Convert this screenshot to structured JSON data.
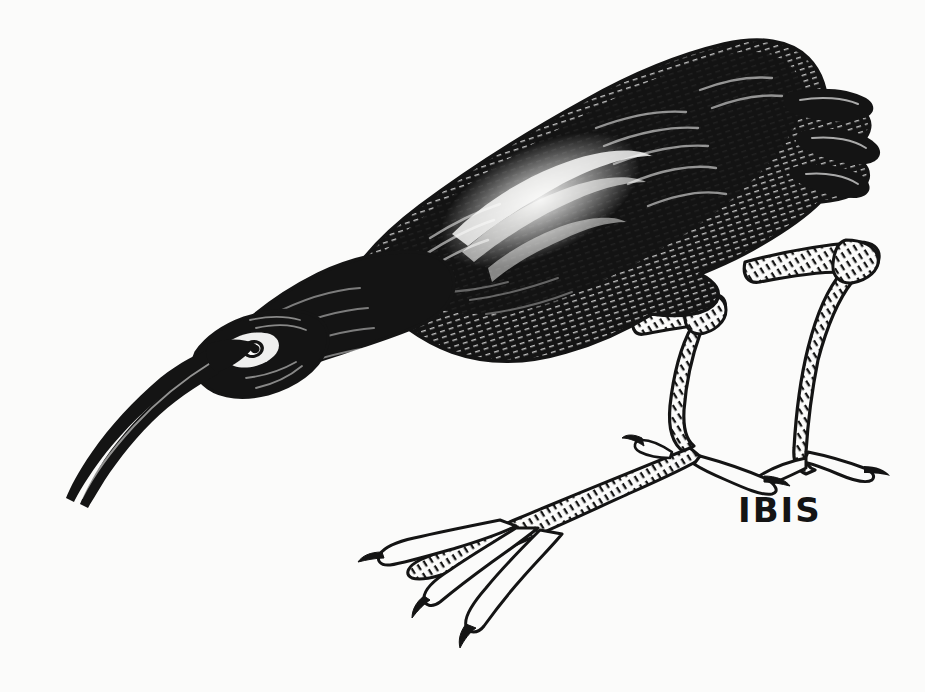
{
  "artwork": {
    "title": "IBIS",
    "caption": "IBIS",
    "medium": "pen-and-ink line drawing",
    "subject": "ibis bird in foraging posture, head lowered, long decurved bill pointed down-left",
    "orientation": "bird faces left",
    "canvas": {
      "width": 925,
      "height": 692,
      "background_color": "#fbfbfa",
      "ink_color": "#141414"
    },
    "caption_position": {
      "x": 738,
      "y": 522
    },
    "parts": [
      {
        "name": "bill",
        "description": "long slender decurved bill sweeping down and left"
      },
      {
        "name": "head",
        "description": "small dark head with pale eye patch and ringed eye"
      },
      {
        "name": "eye",
        "description": "white ring with dark pupil"
      },
      {
        "name": "neck",
        "description": "thick dark neck angled down-left from body"
      },
      {
        "name": "body",
        "description": "heavy dark crosshatched body and mantle"
      },
      {
        "name": "wing",
        "description": "folded wing with pale curving highlight on coverts"
      },
      {
        "name": "tail",
        "description": "dark tail with separated feather tips at upper right"
      },
      {
        "name": "near-leg",
        "description": "scaled leg, left of pair, bent at hock"
      },
      {
        "name": "far-leg",
        "description": "scaled leg, right of pair, bent at hock"
      },
      {
        "name": "feet",
        "description": "long slender toes with claws spread on ground"
      }
    ]
  }
}
